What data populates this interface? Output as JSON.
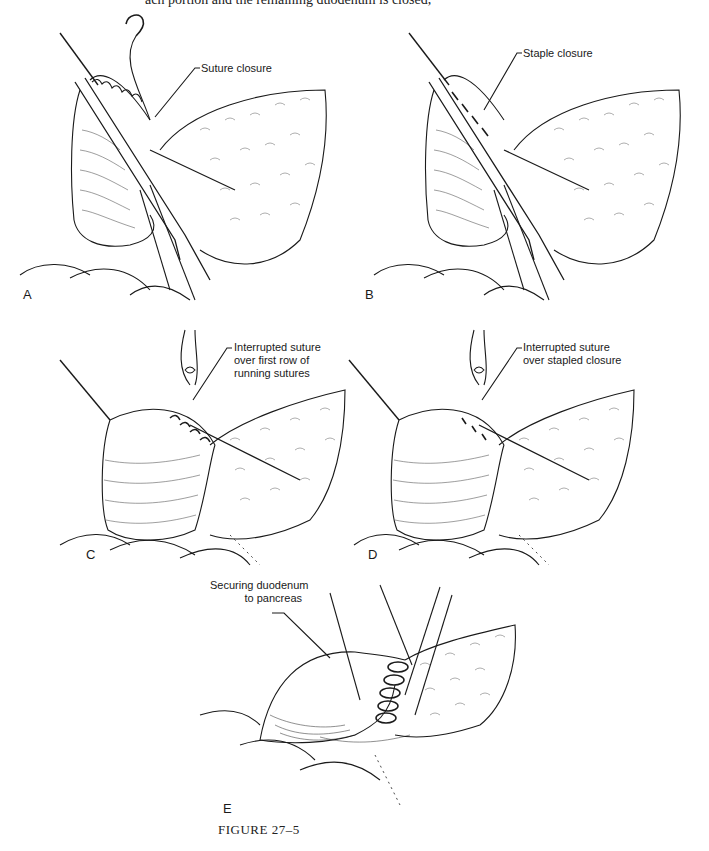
{
  "page": {
    "clipped_text_line": "ach portion and the remaining duodenum is closed,"
  },
  "figure": {
    "caption": "FIGURE 27–5",
    "panels": [
      {
        "letter": "A",
        "callout": "Suture closure"
      },
      {
        "letter": "B",
        "callout": "Staple closure"
      },
      {
        "letter": "C",
        "callout_lines": [
          "Interrupted suture",
          "over first row of",
          "running sutures"
        ]
      },
      {
        "letter": "D",
        "callout_lines": [
          "Interrupted suture",
          "over stapled closure"
        ]
      },
      {
        "letter": "E",
        "callout_lines": [
          "Securing duodenum",
          "to pancreas"
        ]
      }
    ]
  },
  "colors": {
    "ink": "#1a1a1a",
    "background": "#ffffff"
  }
}
